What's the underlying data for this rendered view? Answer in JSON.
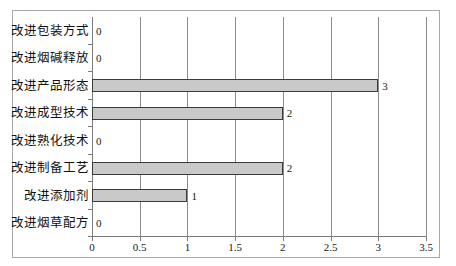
{
  "chart_data": {
    "type": "bar",
    "orientation": "horizontal",
    "title": "",
    "subtitle": "",
    "xlabel": "",
    "ylabel": "",
    "xlim": [
      0,
      3.5
    ],
    "xticks": [
      "0",
      "0.5",
      "1",
      "1.5",
      "2",
      "2.5",
      "3",
      "3.5"
    ],
    "xtick_values": [
      0,
      0.5,
      1,
      1.5,
      2,
      2.5,
      3,
      3.5
    ],
    "grid": "vertical",
    "legend": "none",
    "bar_fill_color": "#c9c9c9",
    "bar_border_color": "#3a3a3a",
    "frame_color": "#a8a8a8",
    "axis_color": "#7a7a7a",
    "gridline_color": "#8c8c8c",
    "categories": [
      "改进包装方式",
      "改进烟碱释放",
      "改进产品形态",
      "改进成型技术",
      "改进熟化技术",
      "改进制备工艺",
      "改进添加剂",
      "改进烟草配方"
    ],
    "values": [
      0,
      0,
      3,
      2,
      0,
      2,
      1,
      0
    ],
    "data_labels": [
      "0",
      "0",
      "3",
      "2",
      "0",
      "2",
      "1",
      "0"
    ]
  }
}
